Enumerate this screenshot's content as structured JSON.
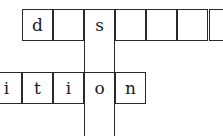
{
  "crossword": {
    "row1": {
      "cells": [
        "d",
        "",
        "s",
        "",
        "",
        "",
        ""
      ]
    },
    "row2": {
      "cells": [
        "i",
        "t",
        "i",
        "o",
        "n"
      ]
    },
    "column": {
      "cells": [
        "s",
        "",
        "o",
        ""
      ]
    }
  }
}
